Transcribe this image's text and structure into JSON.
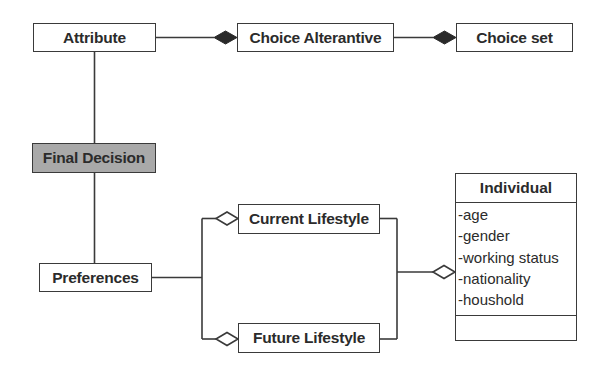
{
  "diagram": {
    "type": "UML class diagram",
    "nodes": {
      "attribute": {
        "label": "Attribute"
      },
      "choice_alternative": {
        "label": "Choice Alterantive"
      },
      "choice_set": {
        "label": "Choice set"
      },
      "final_decision": {
        "label": "Final Decision",
        "fill": "#a9a9a9"
      },
      "preferences": {
        "label": "Preferences"
      },
      "current_lifestyle": {
        "label": "Current Lifestyle"
      },
      "future_lifestyle": {
        "label": "Future Lifestyle"
      },
      "individual": {
        "label": "Individual",
        "attributes": [
          "-age",
          "-gender",
          "-working status",
          "-nationality",
          "-houshold"
        ],
        "operations": []
      }
    },
    "edges": [
      {
        "from": "attribute",
        "to": "choice_alternative",
        "type": "composition",
        "diamond_at": "choice_alternative"
      },
      {
        "from": "choice_alternative",
        "to": "choice_set",
        "type": "composition",
        "diamond_at": "choice_set"
      },
      {
        "from": "attribute",
        "to": "final_decision",
        "type": "association"
      },
      {
        "from": "final_decision",
        "to": "preferences",
        "type": "association"
      },
      {
        "from": "preferences",
        "to": "current_lifestyle",
        "type": "aggregation",
        "diamond_at": "current_lifestyle"
      },
      {
        "from": "preferences",
        "to": "future_lifestyle",
        "type": "aggregation",
        "diamond_at": "future_lifestyle"
      },
      {
        "from": "current_lifestyle",
        "to": "individual",
        "type": "aggregation",
        "diamond_at": "individual"
      },
      {
        "from": "future_lifestyle",
        "to": "individual",
        "type": "aggregation",
        "diamond_at": "individual"
      }
    ],
    "colors": {
      "line": "#3a3a3a",
      "highlight_fill": "#a9a9a9",
      "background": "#ffffff"
    }
  }
}
